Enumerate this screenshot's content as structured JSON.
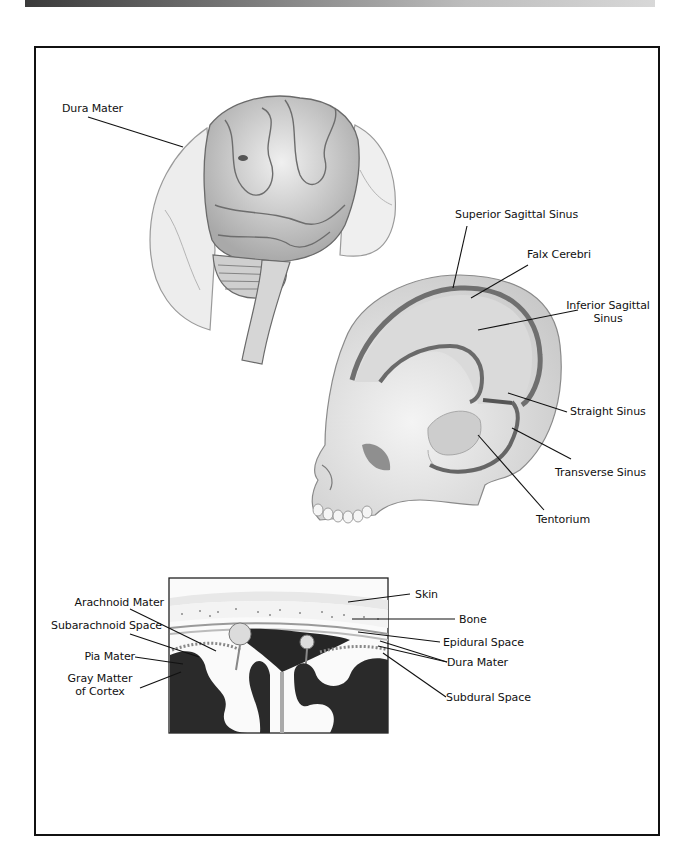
{
  "header_bar": {
    "style": "gradient",
    "colors": [
      "#3a3a3a",
      "#d8d8d8"
    ]
  },
  "figure": {
    "panels": [
      {
        "name": "brain-with-dura",
        "labels": [
          "Dura Mater"
        ]
      },
      {
        "name": "skull-dural-sinuses",
        "labels": [
          "Superior Sagittal Sinus",
          "Falx Cerebri",
          "Inferior Sagittal Sinus",
          "Straight Sinus",
          "Transverse Sinus",
          "Tentorium"
        ]
      },
      {
        "name": "meninges-cross-section",
        "labels_left": [
          "Arachnoid Mater",
          "Subarachnoid Space",
          "Pia Mater",
          "Gray Matter of Cortex"
        ],
        "labels_right": [
          "Skin",
          "Bone",
          "Epidural Space",
          "Dura Mater",
          "Subdural Space"
        ]
      }
    ]
  },
  "labels": {
    "dura_mater_top": "Dura Mater",
    "superior_sagittal_sinus": "Superior Sagittal Sinus",
    "falx_cerebri": "Falx Cerebri",
    "inferior_sagittal_sinus_1": "Inferior Sagittal",
    "inferior_sagittal_sinus_2": "Sinus",
    "straight_sinus": "Straight Sinus",
    "transverse_sinus": "Transverse Sinus",
    "tentorium": "Tentorium",
    "arachnoid_mater": "Arachnoid Mater",
    "subarachnoid_space": "Subarachnoid Space",
    "pia_mater": "Pia Mater",
    "gray_matter_1": "Gray Matter",
    "gray_matter_2": "of Cortex",
    "skin": "Skin",
    "bone": "Bone",
    "epidural_space": "Epidural Space",
    "dura_mater_bottom": "Dura Mater",
    "subdural_space": "Subdural Space"
  },
  "colors": {
    "line": "#111111",
    "sinus": "#6f6f6f",
    "falx": "#d4d4d4",
    "bone": "#ececec",
    "gray_matter": "#2a2a2a"
  }
}
